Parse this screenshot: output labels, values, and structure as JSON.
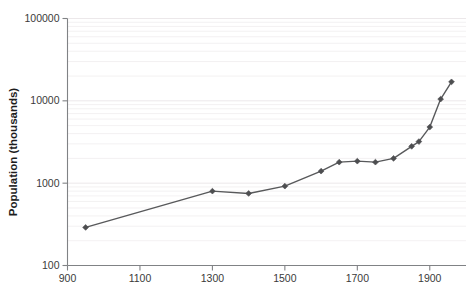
{
  "chart_data": {
    "type": "line",
    "title": "",
    "subtitle": "",
    "xlabel": "",
    "ylabel": "Population (thousands)",
    "xlim": [
      900,
      2000
    ],
    "ylim": [
      100,
      100000
    ],
    "yscale": "log",
    "xscale": "linear",
    "grid": true,
    "grid_axis": "y",
    "grid_minor": true,
    "legend": false,
    "legend_position": "none",
    "xticks": [
      900,
      1100,
      1300,
      1500,
      1700,
      1900
    ],
    "xtick_labels": [
      "900",
      "1100",
      "1300",
      "1500",
      "1700",
      "1900"
    ],
    "yticks": [
      100,
      1000,
      10000,
      100000
    ],
    "ytick_labels": [
      "100",
      "1000",
      "10000",
      "100000"
    ],
    "marker": "diamond",
    "line_color": "#58595b",
    "marker_color": "#4d4e50",
    "axis_color": "#808285",
    "grid_color": "#f2eff0",
    "series": [
      {
        "name": "Population",
        "x": [
          950,
          1300,
          1400,
          1500,
          1600,
          1650,
          1700,
          1750,
          1800,
          1850,
          1870,
          1900,
          1930,
          1960
        ],
        "values": [
          290,
          800,
          750,
          920,
          1400,
          1800,
          1850,
          1800,
          2000,
          2800,
          3200,
          4800,
          10500,
          17000
        ]
      }
    ]
  },
  "axes": {
    "y_title": "Population (thousands)"
  }
}
